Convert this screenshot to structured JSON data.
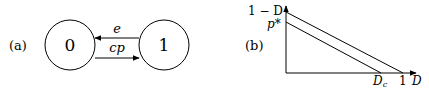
{
  "panel_a": {
    "label": "(a)",
    "states": [
      {
        "id": "0",
        "label": "0"
      },
      {
        "id": "1",
        "label": "1"
      }
    ],
    "transitions": [
      {
        "from": "1",
        "to": "0",
        "label": "e"
      },
      {
        "from": "0",
        "to": "1",
        "label": "cp"
      }
    ]
  },
  "panel_b": {
    "label": "(b)",
    "y_axis_top_label": "1 − D",
    "y_tick_label": "p*",
    "x_tick_label_dc": "D",
    "x_tick_label_dc_sub": "c",
    "x_tick_label_one": "1",
    "x_axis_label": "D"
  }
}
